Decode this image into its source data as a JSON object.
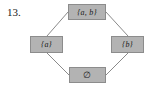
{
  "figure": {
    "item_number": "13.",
    "type": "hasse-diagram",
    "background_color": "#ffffff",
    "node_fill_color": "#b3b3b3",
    "node_border_color": "#8c8c8c",
    "edge_color": "#8a8a8a",
    "text_color": "#1a1a1a"
  },
  "nodes": [
    {
      "id": "top",
      "label": "{a, b}",
      "position": "top"
    },
    {
      "id": "left",
      "label": "{a}",
      "position": "left"
    },
    {
      "id": "right",
      "label": "{b}",
      "position": "right"
    },
    {
      "id": "bottom",
      "label": "∅",
      "position": "bottom"
    }
  ],
  "edges": [
    {
      "from": "left",
      "to": "top"
    },
    {
      "from": "right",
      "to": "top"
    },
    {
      "from": "bottom",
      "to": "left"
    },
    {
      "from": "bottom",
      "to": "right"
    }
  ]
}
